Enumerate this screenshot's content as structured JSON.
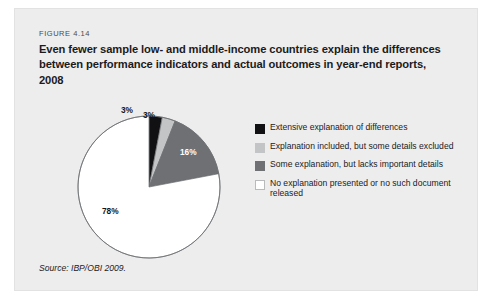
{
  "figure": {
    "number_label": "FIGURE 4.14",
    "title": "Even fewer sample low- and middle-income countries explain the differences between performance indicators and actual outcomes in year-end reports, 2008",
    "source": "Source: IBP/OBI 2009."
  },
  "chart_data": {
    "type": "pie",
    "title": "Even fewer sample low- and middle-income countries explain the differences between performance indicators and actual outcomes in year-end reports, 2008",
    "xlabel": "",
    "ylabel": "",
    "legend_position": "right",
    "grid": false,
    "unit": "%",
    "start_angle_deg": 0,
    "direction": "clockwise",
    "categories": [
      "Extensive explanation of differences",
      "Explanation included, but some details excluded",
      "Some explanation, but lacks important details",
      "No explanation presented or no such document released"
    ],
    "values": [
      3,
      3,
      16,
      78
    ],
    "data_labels": [
      "3%",
      "3%",
      "16%",
      "78%"
    ],
    "colors": [
      "#111113",
      "#c3c4c6",
      "#6e7073",
      "#ffffff"
    ],
    "slice_label_colors": [
      "#161618",
      "#161618",
      "#ffffff",
      "#161618"
    ]
  },
  "legend": {
    "items": [
      {
        "label": "Extensive explanation of differences",
        "color": "#111113"
      },
      {
        "label": "Explanation included, but some details excluded",
        "color": "#c3c4c6"
      },
      {
        "label": "Some explanation, but lacks important details",
        "color": "#6e7073"
      },
      {
        "label": "No explanation presented or no such document released",
        "color": "#ffffff"
      }
    ]
  }
}
